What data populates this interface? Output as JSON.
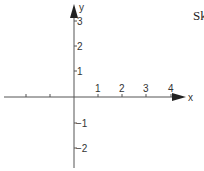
{
  "title_fragment": "Sk",
  "axes": {
    "x_label": "x",
    "y_label": "y",
    "x_ticks": [
      {
        "label": "",
        "px": 26
      },
      {
        "label": "",
        "px": 50
      },
      {
        "label": "1",
        "px": 98
      },
      {
        "label": "2",
        "px": 122
      },
      {
        "label": "3",
        "px": 146
      },
      {
        "label": "4",
        "px": 171
      }
    ],
    "y_ticks": [
      {
        "label": "3",
        "py": 21
      },
      {
        "label": "2",
        "py": 46
      },
      {
        "label": "1",
        "py": 71
      },
      {
        "label": "−1",
        "py": 123
      },
      {
        "label": "−2",
        "py": 148
      }
    ]
  },
  "colors": {
    "axis": "#555555",
    "text": "#333333"
  }
}
